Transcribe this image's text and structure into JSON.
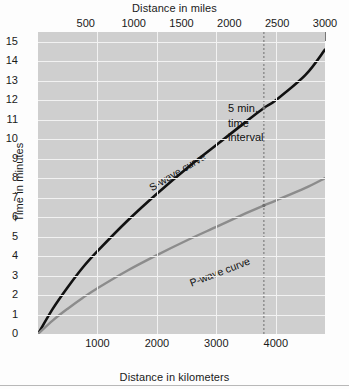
{
  "figure": {
    "top_axis_title": "Distance in miles",
    "bottom_axis_title": "Distance in kilometers",
    "left_axis_title": "Time in minutes"
  },
  "annotations": {
    "s_curve_label": "S-wave curve",
    "p_curve_label": "P-wave curve",
    "interval_line1": "5 min.",
    "interval_line2": "time",
    "interval_line3": "interval"
  },
  "colors": {
    "plot_background": "#cfcfcf",
    "gridline": "#f2f2f2",
    "s_wave": "#111111",
    "p_wave": "#8c8c8c",
    "marker_line": "#6d6d6d",
    "page_background": "#fdfdfd"
  },
  "chart_data": {
    "type": "line",
    "title": "",
    "xlabel": "Distance in kilometers",
    "ylabel": "Time in minutes",
    "xlabel_secondary": "Distance in miles",
    "xlim": [
      0,
      4828
    ],
    "ylim": [
      0,
      15.5
    ],
    "xlim_miles": [
      0,
      3000
    ],
    "xticks": [
      1000,
      2000,
      3000,
      4000
    ],
    "xticks_miles": [
      500,
      1000,
      1500,
      2000,
      2500,
      3000
    ],
    "yticks": [
      0,
      1,
      2,
      3,
      4,
      5,
      6,
      7,
      8,
      9,
      10,
      11,
      12,
      13,
      14,
      15
    ],
    "grid": true,
    "legend": "none",
    "series": [
      {
        "name": "S-wave curve",
        "color": "#111111",
        "x": [
          0,
          250,
          500,
          750,
          1000,
          1500,
          2000,
          2500,
          3000,
          3500,
          3800,
          4000,
          4500,
          4828
        ],
        "y": [
          0,
          1.3,
          2.4,
          3.4,
          4.25,
          5.8,
          7.2,
          8.5,
          9.7,
          10.9,
          11.6,
          12.0,
          13.3,
          14.6
        ]
      },
      {
        "name": "P-wave curve",
        "color": "#8c8c8c",
        "x": [
          0,
          250,
          500,
          750,
          1000,
          1500,
          2000,
          2500,
          3000,
          3500,
          3800,
          4000,
          4500,
          4828
        ],
        "y": [
          0,
          0.7,
          1.3,
          1.85,
          2.35,
          3.25,
          4.05,
          4.8,
          5.5,
          6.2,
          6.6,
          6.85,
          7.5,
          8.0
        ]
      }
    ],
    "markers": [
      {
        "name": "time-interval-marker",
        "x": 3800,
        "y_top": 11.6,
        "y_bottom": 6.6,
        "delta_minutes": 5,
        "label": "5 min. time interval",
        "style": "dashed-vertical"
      }
    ]
  }
}
